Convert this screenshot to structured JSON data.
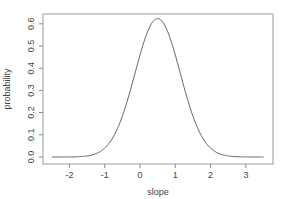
{
  "chart_data": {
    "type": "line",
    "title": "",
    "xlabel": "slope",
    "ylabel": "probability",
    "xlim": [
      -2.6,
      3.7
    ],
    "ylim": [
      -0.02,
      0.66
    ],
    "x_ticks": [
      -2,
      -1,
      0,
      1,
      2,
      3
    ],
    "x_tick_labels": [
      "-2",
      "-1",
      "0",
      "1",
      "2",
      "3"
    ],
    "y_ticks": [
      0.0,
      0.1,
      0.2,
      0.3,
      0.4,
      0.5,
      0.6
    ],
    "y_tick_labels": [
      "0.0",
      "0.1",
      "0.2",
      "0.3",
      "0.4",
      "0.5",
      "0.6"
    ],
    "grid": false,
    "legend": null,
    "series": [
      {
        "name": "density",
        "distribution": "normal",
        "mean": 0.5,
        "sd": 0.64,
        "x": [
          -2.5,
          -2.0,
          -1.5,
          -1.0,
          -0.5,
          0.0,
          0.25,
          0.5,
          0.75,
          1.0,
          1.5,
          2.0,
          2.5,
          3.0,
          3.5
        ],
        "y": [
          0.0,
          0.0,
          0.001,
          0.04,
          0.18,
          0.46,
          0.57,
          0.623,
          0.57,
          0.46,
          0.18,
          0.04,
          0.001,
          0.0,
          0.0
        ]
      }
    ],
    "colors": {
      "line": "#666666",
      "axis": "#888888",
      "text": "#444444"
    }
  }
}
